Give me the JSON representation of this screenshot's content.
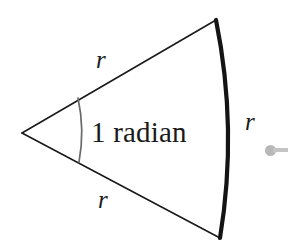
{
  "figure": {
    "background_color": "#ffffff",
    "stroke_color": "#1a1a1a",
    "angle_arc_color": "#595959",
    "marker_color": "#b8b8b8",
    "labels": {
      "radius_top": "r",
      "radius_bottom": "r",
      "radius_arc": "r",
      "angle": "1 radian"
    },
    "geometry": {
      "apex": [
        22,
        133
      ],
      "top_vertex": [
        216,
        20
      ],
      "bottom_vertex": [
        220,
        238
      ],
      "arc_rightmost": [
        222,
        130
      ],
      "angle_arc_start": [
        78,
        98
      ],
      "angle_arc_end": [
        79,
        162
      ],
      "angle_arc_bulge_x": 84,
      "arc_stroke_width": 4,
      "radius_stroke_width": 1.6,
      "angle_arc_stroke_width": 1.6
    },
    "marker": {
      "name": "mouse-pointer-dot",
      "center": [
        272,
        150
      ]
    }
  }
}
